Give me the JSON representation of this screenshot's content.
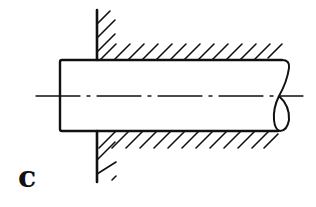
{
  "figure": {
    "label": "c"
  },
  "colors": {
    "ink": "#111111",
    "background": "#ffffff"
  },
  "geometry": {
    "wall_x": 97,
    "wall_top": 10,
    "wall_bottom": 182,
    "shaft_left": 60,
    "shaft_top": 60,
    "shaft_bottom": 131,
    "shaft_right": 285,
    "centerline_y": 96,
    "centerline_x1": 36,
    "centerline_x2": 303,
    "hatch_spacing": 14
  }
}
